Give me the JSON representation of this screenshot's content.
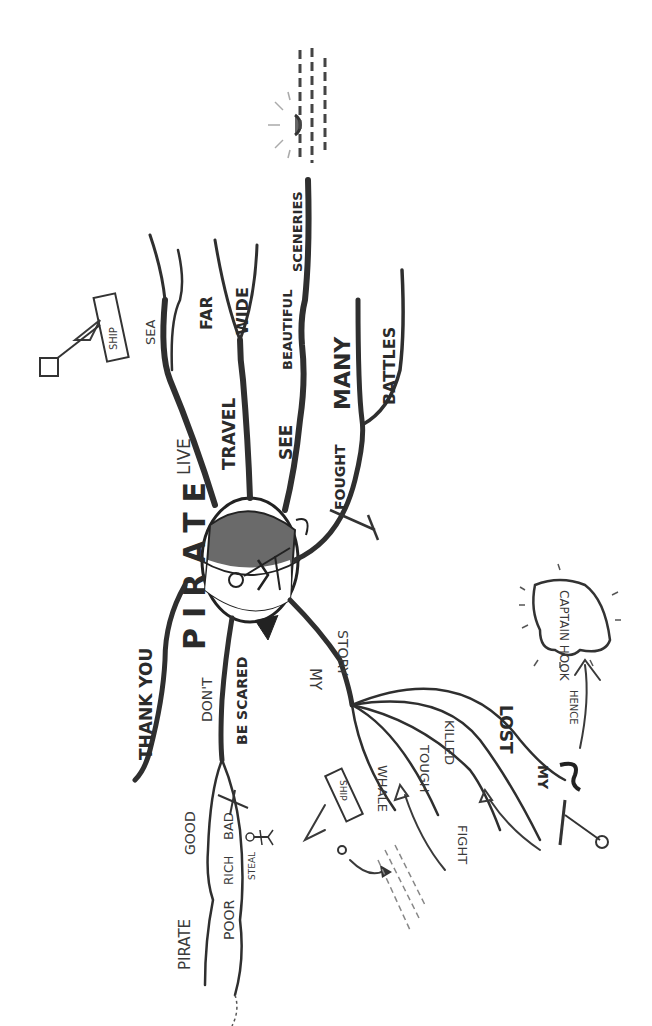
{
  "diagram": {
    "type": "mind-map",
    "orientation": "rotated-90-ccw",
    "center": {
      "label": "PIRATE",
      "icon": "pirate-head-with-eyepatch"
    },
    "branches": [
      {
        "id": "live",
        "label": "LIVE",
        "children": [
          {
            "label": "SEA"
          }
        ],
        "sketch": "ship-icon",
        "sketch_label": "SHIP"
      },
      {
        "id": "travel",
        "label": "TRAVEL",
        "children": [
          {
            "label": "FAR"
          },
          {
            "label": "WIDE"
          }
        ]
      },
      {
        "id": "see",
        "label": "SEE",
        "children": [
          {
            "label": "BEAUTIFUL"
          },
          {
            "label": "SCENERIES"
          }
        ],
        "sketch": "sunset-over-sea-icon"
      },
      {
        "id": "fought",
        "label": "FOUGHT",
        "children": [
          {
            "label": "MANY"
          },
          {
            "label": "BATTLES"
          }
        ],
        "sketch": "sword-icon"
      },
      {
        "id": "my-story",
        "label": "MY",
        "label2": "STORY",
        "children": [
          {
            "label": "WHALE"
          },
          {
            "label": "TOUGH"
          },
          {
            "label": "FIGHT"
          },
          {
            "label": "KILLED"
          },
          {
            "label": "LOST"
          },
          {
            "label": "MY"
          }
        ],
        "sketches": [
          "ship-icon",
          "sword-icon",
          "hook-icon"
        ],
        "sketch_label": "SHIP",
        "hence_label": "HENCE",
        "callout": "CAPTAIN HOOK"
      },
      {
        "id": "dont-be-scared",
        "label": "DON'T",
        "label2": "BE SCARED",
        "children": [
          {
            "label": "GOOD"
          },
          {
            "label": "PIRATE"
          },
          {
            "label": "BAD"
          },
          {
            "label": "RICH"
          },
          {
            "label": "POOR"
          },
          {
            "label": "STEAL"
          }
        ],
        "sketch": "stick-figure-icon"
      },
      {
        "id": "thank-you",
        "label": "THANK YOU"
      }
    ]
  }
}
